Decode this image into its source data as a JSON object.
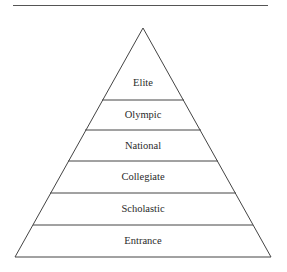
{
  "diagram": {
    "type": "pyramid",
    "levels_top_to_bottom": [
      {
        "label": "Elite"
      },
      {
        "label": "Olympic"
      },
      {
        "label": "National"
      },
      {
        "label": "Collegiate"
      },
      {
        "label": "Scholastic"
      },
      {
        "label": "Entrance"
      }
    ],
    "colors": {
      "stroke": "#444444",
      "fill": "#ffffff",
      "text": "#2a2a2a"
    }
  }
}
